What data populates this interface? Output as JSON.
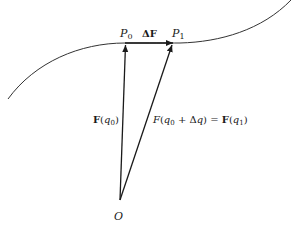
{
  "diagram": {
    "type": "vector-curve",
    "colors": {
      "ink": "#1a1a1a",
      "background": "#ffffff",
      "curve": "#333333"
    },
    "points": {
      "origin": {
        "label": "O"
      },
      "p0": {
        "label": "P",
        "sub": "0"
      },
      "p1": {
        "label": "P",
        "sub": "1"
      }
    },
    "labels": {
      "delta_f": {
        "prefix": "Δ",
        "vec": "F"
      },
      "f_q0": {
        "vec": "F",
        "open": "(",
        "var": "q",
        "sub": "0",
        "close": ")"
      },
      "f_q1": {
        "lhs_f": "F",
        "lhs_open": "(",
        "lhs_var": "q",
        "lhs_sub": "0",
        "plus": " + Δ",
        "dq": "q",
        "lhs_close": ")",
        "eq": " = ",
        "rhs_vec": "F",
        "rhs_open": "(",
        "rhs_var": "q",
        "rhs_sub": "1",
        "rhs_close": ")"
      }
    }
  }
}
